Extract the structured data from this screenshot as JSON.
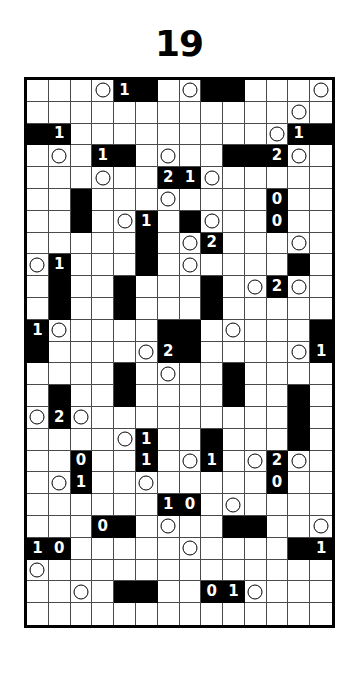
{
  "puzzle": {
    "title": "19",
    "type": "nurikabe-style-logic-grid",
    "columns": 14,
    "rows": 25,
    "colors": {
      "filled": "#000000",
      "empty": "#ffffff",
      "gridline": "#4a4a4a",
      "border": "#000000"
    },
    "legend": {
      "black_cell": "filled/shaded square",
      "white_cell": "empty square",
      "circle": "circle marker",
      "number": "clue digit"
    },
    "cells": [
      [
        {
          "f": 0
        },
        {
          "f": 0
        },
        {
          "f": 0
        },
        {
          "f": 0,
          "c": 1
        },
        {
          "f": 1,
          "n": "1"
        },
        {
          "f": 1
        },
        {
          "f": 0
        },
        {
          "f": 0,
          "c": 1
        },
        {
          "f": 1
        },
        {
          "f": 1
        },
        {
          "f": 0
        },
        {
          "f": 0
        },
        {
          "f": 0
        },
        {
          "f": 0,
          "c": 1
        }
      ],
      [
        {
          "f": 0
        },
        {
          "f": 0
        },
        {
          "f": 0
        },
        {
          "f": 0
        },
        {
          "f": 0
        },
        {
          "f": 0
        },
        {
          "f": 0
        },
        {
          "f": 0
        },
        {
          "f": 0
        },
        {
          "f": 0
        },
        {
          "f": 0
        },
        {
          "f": 0
        },
        {
          "f": 0,
          "c": 1
        },
        {
          "f": 0
        }
      ],
      [
        {
          "f": 1
        },
        {
          "f": 1,
          "n": "1"
        },
        {
          "f": 0
        },
        {
          "f": 0
        },
        {
          "f": 0
        },
        {
          "f": 0
        },
        {
          "f": 0
        },
        {
          "f": 0
        },
        {
          "f": 0
        },
        {
          "f": 0
        },
        {
          "f": 0
        },
        {
          "f": 0,
          "c": 1
        },
        {
          "f": 1,
          "n": "1"
        },
        {
          "f": 1
        }
      ],
      [
        {
          "f": 0
        },
        {
          "f": 0,
          "c": 1
        },
        {
          "f": 0
        },
        {
          "f": 1,
          "n": "1"
        },
        {
          "f": 1
        },
        {
          "f": 0
        },
        {
          "f": 0,
          "c": 1
        },
        {
          "f": 0
        },
        {
          "f": 0
        },
        {
          "f": 1
        },
        {
          "f": 1
        },
        {
          "f": 1,
          "n": "2"
        },
        {
          "f": 0,
          "c": 1
        },
        {
          "f": 0
        }
      ],
      [
        {
          "f": 0
        },
        {
          "f": 0
        },
        {
          "f": 0
        },
        {
          "f": 0,
          "c": 1
        },
        {
          "f": 0
        },
        {
          "f": 0
        },
        {
          "f": 1,
          "n": "2"
        },
        {
          "f": 1,
          "n": "1"
        },
        {
          "f": 0,
          "c": 1
        },
        {
          "f": 0
        },
        {
          "f": 0
        },
        {
          "f": 0
        },
        {
          "f": 0
        },
        {
          "f": 0
        }
      ],
      [
        {
          "f": 0
        },
        {
          "f": 0
        },
        {
          "f": 1
        },
        {
          "f": 0
        },
        {
          "f": 0
        },
        {
          "f": 0
        },
        {
          "f": 0,
          "c": 1
        },
        {
          "f": 0
        },
        {
          "f": 0
        },
        {
          "f": 0
        },
        {
          "f": 0
        },
        {
          "f": 1,
          "n": "0"
        },
        {
          "f": 0
        },
        {
          "f": 0
        }
      ],
      [
        {
          "f": 0
        },
        {
          "f": 0
        },
        {
          "f": 1
        },
        {
          "f": 0
        },
        {
          "f": 0,
          "c": 1
        },
        {
          "f": 1,
          "n": "1"
        },
        {
          "f": 0
        },
        {
          "f": 1
        },
        {
          "f": 0,
          "c": 1
        },
        {
          "f": 0
        },
        {
          "f": 0
        },
        {
          "f": 1,
          "n": "0"
        },
        {
          "f": 0
        },
        {
          "f": 0
        }
      ],
      [
        {
          "f": 0
        },
        {
          "f": 0
        },
        {
          "f": 0
        },
        {
          "f": 0
        },
        {
          "f": 0
        },
        {
          "f": 1
        },
        {
          "f": 0
        },
        {
          "f": 0,
          "c": 1
        },
        {
          "f": 1,
          "n": "2"
        },
        {
          "f": 0
        },
        {
          "f": 0
        },
        {
          "f": 0
        },
        {
          "f": 0,
          "c": 1
        },
        {
          "f": 0
        }
      ],
      [
        {
          "f": 0,
          "c": 1
        },
        {
          "f": 1,
          "n": "1"
        },
        {
          "f": 0
        },
        {
          "f": 0
        },
        {
          "f": 0
        },
        {
          "f": 1
        },
        {
          "f": 0
        },
        {
          "f": 0,
          "c": 1
        },
        {
          "f": 0
        },
        {
          "f": 0
        },
        {
          "f": 0
        },
        {
          "f": 0
        },
        {
          "f": 1
        },
        {
          "f": 0
        }
      ],
      [
        {
          "f": 0
        },
        {
          "f": 1
        },
        {
          "f": 0
        },
        {
          "f": 0
        },
        {
          "f": 1
        },
        {
          "f": 0
        },
        {
          "f": 0
        },
        {
          "f": 0
        },
        {
          "f": 1
        },
        {
          "f": 0
        },
        {
          "f": 0,
          "c": 1
        },
        {
          "f": 1,
          "n": "2"
        },
        {
          "f": 0,
          "c": 1
        },
        {
          "f": 0
        }
      ],
      [
        {
          "f": 0
        },
        {
          "f": 1
        },
        {
          "f": 0
        },
        {
          "f": 0
        },
        {
          "f": 1
        },
        {
          "f": 0
        },
        {
          "f": 0
        },
        {
          "f": 0
        },
        {
          "f": 1
        },
        {
          "f": 0
        },
        {
          "f": 0
        },
        {
          "f": 0
        },
        {
          "f": 0
        },
        {
          "f": 0
        }
      ],
      [
        {
          "f": 1,
          "n": "1"
        },
        {
          "f": 0,
          "c": 1
        },
        {
          "f": 0
        },
        {
          "f": 0
        },
        {
          "f": 0
        },
        {
          "f": 0
        },
        {
          "f": 1
        },
        {
          "f": 1
        },
        {
          "f": 0
        },
        {
          "f": 0,
          "c": 1
        },
        {
          "f": 0
        },
        {
          "f": 0
        },
        {
          "f": 0
        },
        {
          "f": 1
        }
      ],
      [
        {
          "f": 1
        },
        {
          "f": 0
        },
        {
          "f": 0
        },
        {
          "f": 0
        },
        {
          "f": 0
        },
        {
          "f": 0,
          "c": 1
        },
        {
          "f": 1,
          "n": "2"
        },
        {
          "f": 1
        },
        {
          "f": 0
        },
        {
          "f": 0
        },
        {
          "f": 0
        },
        {
          "f": 0
        },
        {
          "f": 0,
          "c": 1
        },
        {
          "f": 1,
          "n": "1"
        }
      ],
      [
        {
          "f": 0
        },
        {
          "f": 0
        },
        {
          "f": 0
        },
        {
          "f": 0
        },
        {
          "f": 1
        },
        {
          "f": 0
        },
        {
          "f": 0,
          "c": 1
        },
        {
          "f": 0
        },
        {
          "f": 0
        },
        {
          "f": 1
        },
        {
          "f": 0
        },
        {
          "f": 0
        },
        {
          "f": 0
        },
        {
          "f": 0
        }
      ],
      [
        {
          "f": 0
        },
        {
          "f": 1
        },
        {
          "f": 0
        },
        {
          "f": 0
        },
        {
          "f": 1
        },
        {
          "f": 0
        },
        {
          "f": 0
        },
        {
          "f": 0
        },
        {
          "f": 0
        },
        {
          "f": 1
        },
        {
          "f": 0
        },
        {
          "f": 0
        },
        {
          "f": 1
        },
        {
          "f": 0
        }
      ],
      [
        {
          "f": 0,
          "c": 1
        },
        {
          "f": 1,
          "n": "2"
        },
        {
          "f": 0,
          "c": 1
        },
        {
          "f": 0
        },
        {
          "f": 0
        },
        {
          "f": 0
        },
        {
          "f": 0
        },
        {
          "f": 0
        },
        {
          "f": 0
        },
        {
          "f": 0
        },
        {
          "f": 0
        },
        {
          "f": 0
        },
        {
          "f": 1
        },
        {
          "f": 0
        }
      ],
      [
        {
          "f": 0
        },
        {
          "f": 0
        },
        {
          "f": 0
        },
        {
          "f": 0
        },
        {
          "f": 0,
          "c": 1
        },
        {
          "f": 1,
          "n": "1"
        },
        {
          "f": 0
        },
        {
          "f": 0
        },
        {
          "f": 1
        },
        {
          "f": 0
        },
        {
          "f": 0
        },
        {
          "f": 0
        },
        {
          "f": 1
        },
        {
          "f": 0
        }
      ],
      [
        {
          "f": 0
        },
        {
          "f": 0
        },
        {
          "f": 1,
          "n": "0"
        },
        {
          "f": 0
        },
        {
          "f": 0
        },
        {
          "f": 1,
          "n": "1"
        },
        {
          "f": 0
        },
        {
          "f": 0,
          "c": 1
        },
        {
          "f": 1,
          "n": "1"
        },
        {
          "f": 0
        },
        {
          "f": 0,
          "c": 1
        },
        {
          "f": 1,
          "n": "2"
        },
        {
          "f": 0,
          "c": 1
        },
        {
          "f": 0
        }
      ],
      [
        {
          "f": 0
        },
        {
          "f": 0,
          "c": 1
        },
        {
          "f": 1,
          "n": "1"
        },
        {
          "f": 0
        },
        {
          "f": 0
        },
        {
          "f": 0,
          "c": 1
        },
        {
          "f": 0
        },
        {
          "f": 0
        },
        {
          "f": 0
        },
        {
          "f": 0
        },
        {
          "f": 0
        },
        {
          "f": 1,
          "n": "0"
        },
        {
          "f": 0
        },
        {
          "f": 0
        }
      ],
      [
        {
          "f": 0
        },
        {
          "f": 0
        },
        {
          "f": 0
        },
        {
          "f": 0
        },
        {
          "f": 0
        },
        {
          "f": 0
        },
        {
          "f": 1,
          "n": "1"
        },
        {
          "f": 1,
          "n": "0"
        },
        {
          "f": 0
        },
        {
          "f": 0,
          "c": 1
        },
        {
          "f": 0
        },
        {
          "f": 0
        },
        {
          "f": 0
        },
        {
          "f": 0
        }
      ],
      [
        {
          "f": 0
        },
        {
          "f": 0
        },
        {
          "f": 0
        },
        {
          "f": 1,
          "n": "0"
        },
        {
          "f": 1
        },
        {
          "f": 0
        },
        {
          "f": 0,
          "c": 1
        },
        {
          "f": 0
        },
        {
          "f": 0
        },
        {
          "f": 1
        },
        {
          "f": 1
        },
        {
          "f": 0
        },
        {
          "f": 0
        },
        {
          "f": 0,
          "c": 1
        }
      ],
      [
        {
          "f": 1,
          "n": "1"
        },
        {
          "f": 1,
          "n": "0"
        },
        {
          "f": 0
        },
        {
          "f": 0
        },
        {
          "f": 0
        },
        {
          "f": 0
        },
        {
          "f": 0
        },
        {
          "f": 0,
          "c": 1
        },
        {
          "f": 0
        },
        {
          "f": 0
        },
        {
          "f": 0
        },
        {
          "f": 0
        },
        {
          "f": 1
        },
        {
          "f": 1,
          "n": "1"
        }
      ],
      [
        {
          "f": 0,
          "c": 1
        },
        {
          "f": 0
        },
        {
          "f": 0
        },
        {
          "f": 0
        },
        {
          "f": 0
        },
        {
          "f": 0
        },
        {
          "f": 0
        },
        {
          "f": 0
        },
        {
          "f": 0
        },
        {
          "f": 0
        },
        {
          "f": 0
        },
        {
          "f": 0
        },
        {
          "f": 0
        },
        {
          "f": 0
        }
      ],
      [
        {
          "f": 0
        },
        {
          "f": 0
        },
        {
          "f": 0,
          "c": 1
        },
        {
          "f": 0
        },
        {
          "f": 1
        },
        {
          "f": 1
        },
        {
          "f": 0
        },
        {
          "f": 0
        },
        {
          "f": 1,
          "n": "0"
        },
        {
          "f": 1,
          "n": "1"
        },
        {
          "f": 0,
          "c": 1
        },
        {
          "f": 0
        },
        {
          "f": 0
        },
        {
          "f": 0
        }
      ],
      [
        {
          "f": 0
        },
        {
          "f": 0
        },
        {
          "f": 0
        },
        {
          "f": 0
        },
        {
          "f": 0
        },
        {
          "f": 0
        },
        {
          "f": 0
        },
        {
          "f": 0
        },
        {
          "f": 0
        },
        {
          "f": 0
        },
        {
          "f": 0
        },
        {
          "f": 0
        },
        {
          "f": 0
        },
        {
          "f": 0
        }
      ]
    ]
  }
}
